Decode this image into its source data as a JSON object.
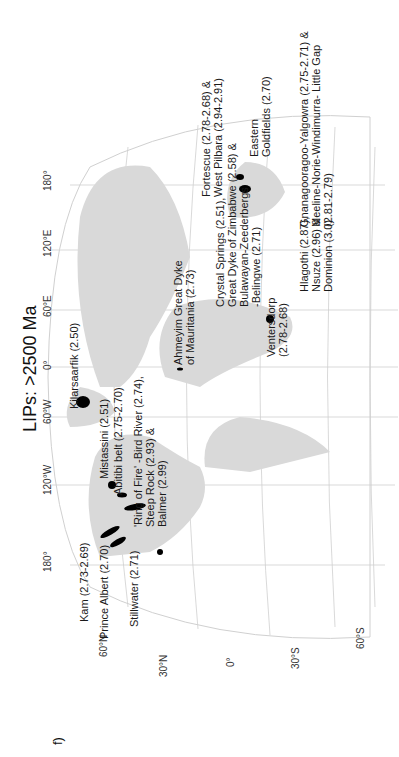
{
  "panel_label": "f)",
  "title": "LIPs: >2500 Ma",
  "longitude_labels": [
    "180°",
    "120°W",
    "60°W",
    "0°",
    "60°E",
    "120°E",
    "180°"
  ],
  "latitude_labels": [
    "60°N",
    "30°N",
    "0°",
    "30°S",
    "60°S"
  ],
  "lips": [
    {
      "name": "Kam (2.73-2.69)"
    },
    {
      "name": "Prince Albert (2.70)"
    },
    {
      "name": "Stillwater (2.71)"
    },
    {
      "name": "Kilarsaarfik (2.50)"
    },
    {
      "name": "Mistassini (2.51)"
    },
    {
      "name": "Abitibi belt (2.75-2.70)"
    },
    {
      "name": "'Ring of Fire' -Bird River (2.74),"
    },
    {
      "name": "Steep Rock (2.93) &"
    },
    {
      "name": "Balmer (2.99)"
    },
    {
      "name": "Ahmeyim Great Dyke"
    },
    {
      "name": "of Mauritania (2.73)"
    },
    {
      "name": "Crystal Springs (2.51),"
    },
    {
      "name": "Great Dyke of Zimbabwe (2.58) &"
    },
    {
      "name": "Bulawayan-Zeederbergs"
    },
    {
      "name": "-Belingwe (2.71)"
    },
    {
      "name": "Ventersdorp"
    },
    {
      "name": "(2.78-2.68)"
    },
    {
      "name": "Hlagothi (2.87),"
    },
    {
      "name": "Nsuze (2.96) &"
    },
    {
      "name": "Dominion (3.0)"
    },
    {
      "name": "Fortescue (2.78-2.68) &"
    },
    {
      "name": "West Pilbara (2.94-2.91)"
    },
    {
      "name": "Eastern"
    },
    {
      "name": "Goldfields (2.70)"
    },
    {
      "name": "Gnanagooragoo-Yalgowra (2.75-2.71) &"
    },
    {
      "name": "Meeline-Norie-Windimurra- Little Gap"
    },
    {
      "name": "(2.81-2.79)"
    }
  ],
  "colors": {
    "land": "#d9d9d9",
    "grid": "#c8c8c8",
    "lip": "#000000"
  }
}
